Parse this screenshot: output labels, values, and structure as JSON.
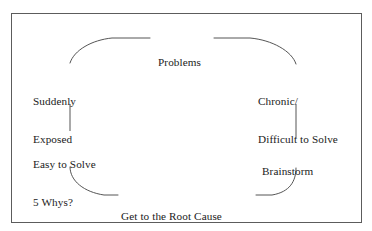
{
  "figure": {
    "type": "cycle-diagram",
    "title_text": "Problems",
    "border_color": "#5c5c5c",
    "text_color": "#1a1a1a",
    "background_color": "#ffffff",
    "line_color": "#555555"
  },
  "nodes": {
    "top": {
      "name": "problems",
      "lines": [
        "Problems"
      ],
      "line1": "Problems"
    },
    "upper_left": {
      "name": "suddenly-exposed",
      "lines": [
        "Suddenly",
        "Exposed"
      ],
      "line1": "Suddenly",
      "line2": "Exposed"
    },
    "upper_right": {
      "name": "chronic-difficult-to-solve",
      "lines": [
        "Chronic/",
        "Difficult to Solve"
      ],
      "line1": "Chronic/",
      "line2": "Difficult to Solve"
    },
    "lower_left": {
      "name": "easy-to-solve-5-whys",
      "lines": [
        "Easy to Solve",
        "5 Whys?"
      ],
      "line1": "Easy to Solve",
      "line2": "5 Whys?"
    },
    "lower_right": {
      "name": "brainstorm",
      "lines": [
        "Brainstorm"
      ],
      "line1": "Brainstorm"
    },
    "bottom": {
      "name": "get-to-the-root-cause",
      "lines": [
        "Get to the Root Cause",
        "and Develop Responses"
      ],
      "line1": "Get to the Root Cause",
      "line2": "and Develop Responses"
    }
  },
  "connectors": [
    {
      "name": "arc-top-left",
      "from": "suddenly-exposed",
      "to": "problems"
    },
    {
      "name": "arc-top-right",
      "from": "problems",
      "to": "chronic-difficult-to-solve"
    },
    {
      "name": "line-left-vertical",
      "from": "suddenly-exposed",
      "to": "easy-to-solve-5-whys"
    },
    {
      "name": "line-right-vertical",
      "from": "chronic-difficult-to-solve",
      "to": "brainstorm"
    },
    {
      "name": "arc-bottom-left",
      "from": "easy-to-solve-5-whys",
      "to": "get-to-the-root-cause"
    },
    {
      "name": "arc-bottom-right",
      "from": "get-to-the-root-cause",
      "to": "brainstorm"
    }
  ]
}
